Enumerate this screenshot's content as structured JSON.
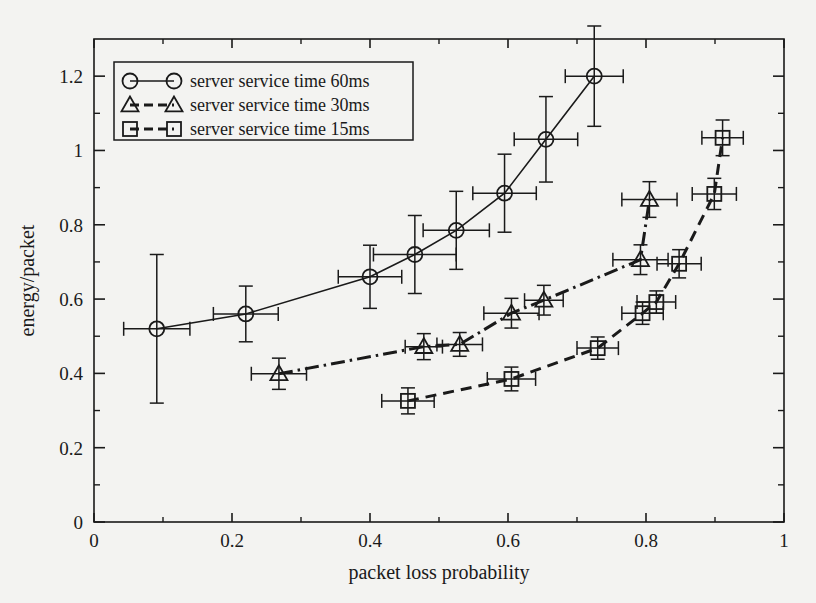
{
  "chart_data": {
    "type": "line",
    "title": "",
    "xlabel": "packet loss probability",
    "ylabel": "energy/packet",
    "xlim": [
      0,
      1
    ],
    "ylim": [
      0,
      1.3
    ],
    "xticks": [
      "0",
      "0.2",
      "0.4",
      "0.6",
      "0.8",
      "1"
    ],
    "xtick_values": [
      0,
      0.2,
      0.4,
      0.6,
      0.8,
      1
    ],
    "yticks": [
      "0",
      "0.2",
      "0.4",
      "0.6",
      "0.8",
      "1",
      "1.2"
    ],
    "ytick_values": [
      0,
      0.2,
      0.4,
      0.6,
      0.8,
      1,
      1.2
    ],
    "minor_ticks": true,
    "grid": false,
    "legend_position": "top-left",
    "error_bars": "xy",
    "series": [
      {
        "name": "server service time 60ms",
        "marker": "circle",
        "line_style": "solid",
        "points": [
          {
            "x": 0.091,
            "y": 0.52,
            "xerr": 0.048,
            "yerr_low": 0.2,
            "yerr_high": 0.2
          },
          {
            "x": 0.22,
            "y": 0.56,
            "xerr": 0.047,
            "yerr_low": 0.075,
            "yerr_high": 0.075
          },
          {
            "x": 0.4,
            "y": 0.66,
            "xerr": 0.046,
            "yerr_low": 0.085,
            "yerr_high": 0.085
          },
          {
            "x": 0.465,
            "y": 0.72,
            "xerr": 0.06,
            "yerr_low": 0.105,
            "yerr_high": 0.105
          },
          {
            "x": 0.525,
            "y": 0.785,
            "xerr": 0.048,
            "yerr_low": 0.105,
            "yerr_high": 0.105
          },
          {
            "x": 0.595,
            "y": 0.885,
            "xerr": 0.046,
            "yerr_low": 0.105,
            "yerr_high": 0.105
          },
          {
            "x": 0.655,
            "y": 1.03,
            "xerr": 0.046,
            "yerr_low": 0.115,
            "yerr_high": 0.115
          },
          {
            "x": 0.725,
            "y": 1.2,
            "xerr": 0.042,
            "yerr_low": 0.135,
            "yerr_high": 0.135
          }
        ]
      },
      {
        "name": "server service time 30ms",
        "marker": "triangle",
        "line_style": "dash-dot",
        "points": [
          {
            "x": 0.268,
            "y": 0.399,
            "xerr": 0.04,
            "yerr_low": 0.042,
            "yerr_high": 0.042
          },
          {
            "x": 0.478,
            "y": 0.472,
            "xerr": 0.027,
            "yerr_low": 0.035,
            "yerr_high": 0.035
          },
          {
            "x": 0.53,
            "y": 0.478,
            "xerr": 0.033,
            "yerr_low": 0.032,
            "yerr_high": 0.032
          },
          {
            "x": 0.605,
            "y": 0.562,
            "xerr": 0.04,
            "yerr_low": 0.04,
            "yerr_high": 0.04
          },
          {
            "x": 0.652,
            "y": 0.597,
            "xerr": 0.028,
            "yerr_low": 0.04,
            "yerr_high": 0.04
          },
          {
            "x": 0.792,
            "y": 0.706,
            "xerr": 0.04,
            "yerr_low": 0.04,
            "yerr_high": 0.04
          },
          {
            "x": 0.805,
            "y": 0.868,
            "xerr": 0.04,
            "yerr_low": 0.048,
            "yerr_high": 0.048
          }
        ]
      },
      {
        "name": "server service time 15ms",
        "marker": "square",
        "line_style": "dashed",
        "points": [
          {
            "x": 0.455,
            "y": 0.326,
            "xerr": 0.038,
            "yerr_low": 0.035,
            "yerr_high": 0.035
          },
          {
            "x": 0.605,
            "y": 0.385,
            "xerr": 0.035,
            "yerr_low": 0.032,
            "yerr_high": 0.032
          },
          {
            "x": 0.73,
            "y": 0.468,
            "xerr": 0.03,
            "yerr_low": 0.03,
            "yerr_high": 0.03
          },
          {
            "x": 0.795,
            "y": 0.562,
            "xerr": 0.03,
            "yerr_low": 0.03,
            "yerr_high": 0.03
          },
          {
            "x": 0.815,
            "y": 0.592,
            "xerr": 0.028,
            "yerr_low": 0.03,
            "yerr_high": 0.03
          },
          {
            "x": 0.848,
            "y": 0.695,
            "xerr": 0.032,
            "yerr_low": 0.038,
            "yerr_high": 0.038
          },
          {
            "x": 0.899,
            "y": 0.883,
            "xerr": 0.032,
            "yerr_low": 0.042,
            "yerr_high": 0.042
          },
          {
            "x": 0.911,
            "y": 1.034,
            "xerr": 0.03,
            "yerr_low": 0.048,
            "yerr_high": 0.048
          }
        ]
      }
    ],
    "colors": {
      "axis": "#1a1a1a",
      "series": [
        "#1a1a1a",
        "#1a1a1a",
        "#1a1a1a"
      ],
      "background": "#f3f3f1"
    }
  }
}
